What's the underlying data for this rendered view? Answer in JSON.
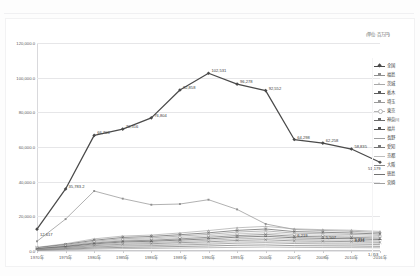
{
  "document": {
    "header_left": "",
    "header_center": "",
    "header_right": ""
  },
  "chart": {
    "unit_note": "(単位:百万円)"
  },
  "legend": {
    "position": "right",
    "items": [
      {
        "label": "全国",
        "color": "#4a4a4a",
        "marker": "diamond"
      },
      {
        "label": "福島",
        "color": "#8f8f8f",
        "marker": "square"
      },
      {
        "label": "茨城",
        "color": "#a8a8a8",
        "marker": "triangle"
      },
      {
        "label": "栃木",
        "color": "#5d5d5d",
        "marker": "cross"
      },
      {
        "label": "埼玉",
        "color": "#9a9a9a",
        "marker": "star"
      },
      {
        "label": "東京",
        "color": "#b5b5b5",
        "marker": "circle"
      },
      {
        "label": "神奈川",
        "color": "#6b6b6b",
        "marker": "plus"
      },
      {
        "label": "福井",
        "color": "#555555",
        "marker": "bar"
      },
      {
        "label": "長野",
        "color": "#9f9f9f",
        "marker": "none"
      },
      {
        "label": "愛知",
        "color": "#777777",
        "marker": "cross"
      },
      {
        "label": "京都",
        "color": "#bdbdbd",
        "marker": "none"
      },
      {
        "label": "大阪",
        "color": "#888888",
        "marker": "none"
      },
      {
        "label": "徳島",
        "color": "#727272",
        "marker": "none"
      },
      {
        "label": "宮崎",
        "color": "#a0a0a0",
        "marker": "none"
      }
    ]
  },
  "chart_data": {
    "type": "line",
    "title": "",
    "subtitle": "",
    "xlabel": "",
    "ylabel": "",
    "unit": "(単位:百万円)",
    "grid": true,
    "legend_position": "right",
    "ylim": [
      0,
      120000
    ],
    "yticks": [
      "0.0",
      "20,000.0",
      "40,000.0",
      "60,000.0",
      "80,000.0",
      "100,000.0",
      "120,000.0"
    ],
    "ytick_values": [
      0,
      20000,
      40000,
      60000,
      80000,
      100000,
      120000
    ],
    "categories": [
      "1970年",
      "1975年",
      "1980年",
      "1985年",
      "1986年",
      "1989年",
      "1990年",
      "1995年",
      "2000年",
      "2007年",
      "2008年",
      "2010年",
      "2016年"
    ],
    "series": [
      {
        "name": "全国",
        "color": "#4a4a4a",
        "marker": "diamond",
        "values": [
          12617,
          35783,
          66700,
          70316,
          76804,
          92858,
          102531,
          96278,
          92552,
          64298,
          62258,
          58835,
          51179
        ],
        "labels": [
          "12,617",
          "35,783.2",
          "66,700",
          "70,316",
          "76,804",
          "92,858",
          "102,531",
          "96,278",
          "92,552",
          "64,298",
          "62,258",
          "58,835",
          "51,179"
        ]
      },
      {
        "name": "福島",
        "color": "#8f8f8f",
        "marker": "square",
        "values": [
          5600,
          18400,
          34600,
          30200,
          26700,
          27100,
          29600,
          24000,
          15600,
          12400,
          11800,
          11400,
          10600
        ],
        "labels": []
      },
      {
        "name": "茨城",
        "color": "#a8a8a8",
        "marker": "triangle",
        "values": [
          2100,
          4200,
          7000,
          8600,
          9200,
          10400,
          11800,
          13400,
          14200,
          12800,
          12300,
          12000,
          11300
        ],
        "labels": []
      },
      {
        "name": "栃木",
        "color": "#5d5d5d",
        "marker": "cross",
        "values": [
          1900,
          3800,
          6200,
          7800,
          8400,
          9400,
          10500,
          11900,
          12700,
          11200,
          10800,
          10400,
          9800
        ],
        "labels": []
      },
      {
        "name": "埼玉",
        "color": "#9a9a9a",
        "marker": "star",
        "values": [
          1700,
          3300,
          5600,
          7100,
          7600,
          8600,
          9600,
          10900,
          11600,
          10300,
          9900,
          9600,
          9000
        ],
        "labels": []
      },
      {
        "name": "東京",
        "color": "#b5b5b5",
        "marker": "circle",
        "values": [
          1500,
          3000,
          5100,
          6400,
          6900,
          7800,
          8700,
          9900,
          10500,
          9400,
          9000,
          8700,
          8200
        ],
        "labels": []
      },
      {
        "name": "神奈川",
        "color": "#6b6b6b",
        "marker": "plus",
        "values": [
          1300,
          2700,
          4600,
          5800,
          6200,
          7000,
          7900,
          8900,
          9500,
          8500,
          8200,
          7900,
          7400
        ],
        "labels": []
      },
      {
        "name": "福井",
        "color": "#555555",
        "marker": "bar",
        "values": [
          1200,
          2400,
          4100,
          5200,
          5600,
          6300,
          7000,
          8000,
          8500,
          7600,
          7300,
          7100,
          6600
        ],
        "labels": [
          "",
          "",
          "",
          "",
          "",
          "",
          "",
          "",
          "",
          "6,219",
          "",
          "",
          ""
        ]
      },
      {
        "name": "長野",
        "color": "#9f9f9f",
        "marker": "none",
        "values": [
          1000,
          2100,
          3600,
          4600,
          4900,
          5500,
          6200,
          7000,
          7500,
          6700,
          6400,
          6200,
          5800
        ],
        "labels": [
          "",
          "",
          "",
          "",
          "",
          "",
          "",
          "",
          "",
          "",
          "5,507",
          "",
          ""
        ]
      },
      {
        "name": "愛知",
        "color": "#777777",
        "marker": "cross",
        "values": [
          900,
          1800,
          3100,
          3900,
          4200,
          4800,
          5300,
          6100,
          6500,
          5800,
          5600,
          5400,
          5000
        ],
        "labels": [
          "",
          "",
          "",
          "",
          "",
          "",
          "",
          "",
          "",
          "",
          "",
          "5,414",
          ""
        ]
      },
      {
        "name": "京都",
        "color": "#bdbdbd",
        "marker": "none",
        "values": [
          800,
          1600,
          2700,
          3400,
          3700,
          4100,
          4600,
          5300,
          5600,
          5000,
          4800,
          4700,
          4400
        ],
        "labels": [
          "",
          "",
          "",
          "",
          "",
          "",
          "",
          "",
          "",
          "",
          "",
          "4,221",
          ""
        ]
      },
      {
        "name": "大阪",
        "color": "#888888",
        "marker": "none",
        "values": [
          700,
          1400,
          2300,
          2900,
          3100,
          3500,
          3900,
          4500,
          4800,
          4300,
          4100,
          4000,
          3700
        ],
        "labels": []
      },
      {
        "name": "徳島",
        "color": "#727272",
        "marker": "none",
        "values": [
          500,
          1000,
          1700,
          2100,
          2300,
          2600,
          2900,
          3300,
          3500,
          3100,
          3000,
          2900,
          2700
        ],
        "labels": []
      },
      {
        "name": "宮崎",
        "color": "#a0a0a0",
        "marker": "none",
        "values": [
          400,
          700,
          1100,
          1400,
          1500,
          1700,
          1900,
          2100,
          2300,
          2100,
          2000,
          1950,
          1853
        ],
        "labels": [
          "",
          "",
          "",
          "",
          "",
          "",
          "",
          "",
          "",
          "",
          "",
          "",
          "1,853"
        ]
      }
    ]
  }
}
